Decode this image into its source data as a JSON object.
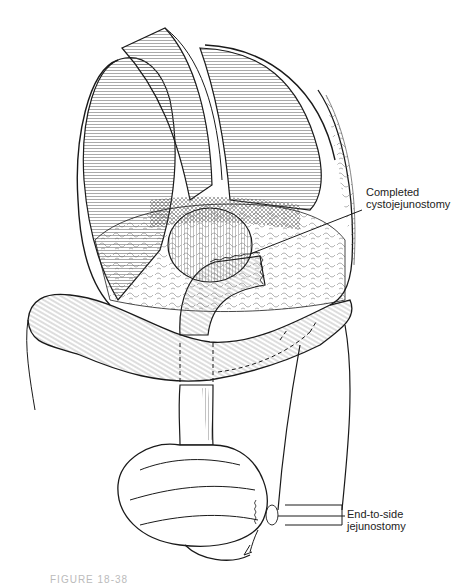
{
  "figure": {
    "ink_color": "#1a1a1a",
    "background": "#ffffff"
  },
  "labels": [
    {
      "id": "cysto",
      "line1": "Completed",
      "line2": "cystojejunostomy"
    },
    {
      "id": "jejuno",
      "line1": "End-to-side",
      "line2": "jejunostomy"
    }
  ],
  "caption": {
    "text": "FIGURE 18-38"
  }
}
